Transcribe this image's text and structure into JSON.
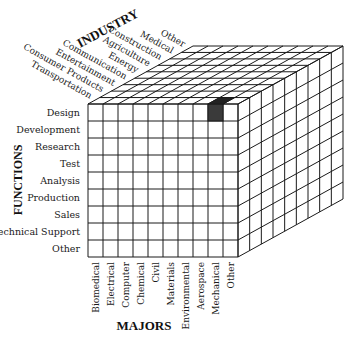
{
  "diagram": {
    "type": "3d-cube-matrix",
    "axes": {
      "industry": {
        "title": "INDUSTRY",
        "labels": [
          "Transportation",
          "Consumer Products",
          "Entertainment",
          "Communication",
          "Energy",
          "Agriculture",
          "Construction",
          "Medical",
          "Other"
        ]
      },
      "functions": {
        "title": "FUNCTIONS",
        "labels": [
          "Design",
          "Development",
          "Research",
          "Test",
          "Analysis",
          "Production",
          "Sales",
          "Technical Support",
          "Other"
        ]
      },
      "majors": {
        "title": "MAJORS",
        "labels": [
          "Biomedical",
          "Electrical",
          "Computer",
          "Chemical",
          "Civil",
          "Materials",
          "Environmental",
          "Aerospace",
          "Mechanical",
          "Other"
        ]
      }
    },
    "highlighted_cell": {
      "major": "Mechanical",
      "function": "Design",
      "industry": "Transportation",
      "color": "#3a3a3a"
    },
    "colors": {
      "line": "#1a1a1a",
      "face": "#ffffff"
    }
  }
}
